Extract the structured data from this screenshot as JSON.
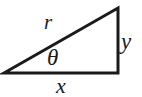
{
  "figure": {
    "kind": "right-triangle-diagram",
    "background_color": "#ffffff",
    "stroke_color": "#1a1a1a",
    "label_color": "#1a1a1a"
  },
  "labels": {
    "hypotenuse": "r",
    "angle": "θ",
    "vertical_leg": "y",
    "horizontal_leg": "x"
  },
  "geometry": {
    "vertices": {
      "left": [
        4,
        73
      ],
      "top_right": [
        118,
        8
      ],
      "bottom_right": [
        118,
        73
      ]
    },
    "stroke_width": 3
  }
}
